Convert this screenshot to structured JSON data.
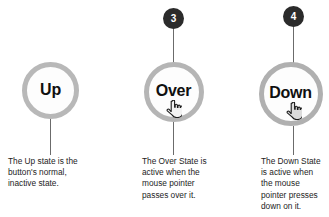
{
  "diagram": {
    "colors": {
      "badge_bg": "#2b2b2b",
      "badge_text": "#ffffff",
      "ring": "#b5b5b5",
      "circle_fill": "#fdfdfd",
      "connector": "#6b6b6b",
      "caption_text": "#1d1d1d"
    },
    "states": [
      {
        "id": "up",
        "label": "Up",
        "badge": null,
        "cursor_icon": null,
        "caption_lines": [
          "The Up state is the",
          "button's normal,",
          "inactive state."
        ]
      },
      {
        "id": "over",
        "label": "Over",
        "badge": "3",
        "cursor_icon": "pointing-hand-cursor",
        "caption_lines": [
          "The Over State is",
          "active when the",
          "mouse pointer",
          "passes over it."
        ]
      },
      {
        "id": "down",
        "label": "Down",
        "badge": "4",
        "cursor_icon": "pointing-hand-cursor-pressed",
        "caption_lines": [
          "The Down State",
          "is active when",
          "the mouse",
          "pointer presses",
          "down on it."
        ]
      }
    ]
  }
}
